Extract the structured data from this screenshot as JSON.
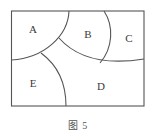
{
  "figure": {
    "caption": "图 5",
    "frame": {
      "x": 11.5,
      "y": 11,
      "width": 132.5,
      "height": 95
    },
    "line_color": "#555555",
    "regions": [
      {
        "id": "A",
        "label": "A",
        "x": 33,
        "y": 29
      },
      {
        "id": "B",
        "label": "B",
        "x": 88,
        "y": 34
      },
      {
        "id": "C",
        "label": "C",
        "x": 129,
        "y": 38
      },
      {
        "id": "D",
        "label": "D",
        "x": 101,
        "y": 86
      },
      {
        "id": "E",
        "label": "E",
        "x": 33,
        "y": 83
      }
    ],
    "boundaries": [
      {
        "name": "arc-A",
        "between": [
          "A",
          "B/E"
        ],
        "d": "M 69 11 C 68 36, 44 58, 11.5 60"
      },
      {
        "name": "arc-BC-lower",
        "between": [
          "B",
          "C",
          "D"
        ],
        "d": "M 59 38 C 74 55, 100 66, 144 59"
      },
      {
        "name": "arc-B-C",
        "between": [
          "B",
          "C"
        ],
        "d": "M 104 11 C 114 26, 113 48, 100 63"
      },
      {
        "name": "arc-E-D",
        "between": [
          "E",
          "D"
        ],
        "d": "M 41 53 C 56 64, 66 82, 66 106"
      }
    ]
  }
}
